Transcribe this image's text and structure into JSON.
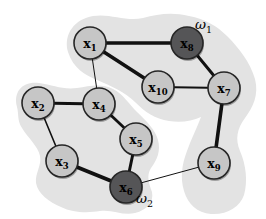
{
  "diagram": {
    "width": 266,
    "height": 219,
    "node_radius": 16,
    "colors": {
      "background": "#ffffff",
      "cluster_fill": "#e3e3e3",
      "node_light_fill": "#c6c6c6",
      "node_dark_fill": "#555557",
      "node_stroke": "#262626",
      "edge_stroke": "#111111",
      "label_color": "#000000",
      "node_shadow": "rgba(0,0,0,0.30)"
    },
    "clusters": [
      {
        "id": "omega1",
        "label": "ω",
        "sub": "1",
        "label_x": 195,
        "label_y": 29,
        "path": "M 68,52 C 63,34 75,19 93,16 C 110,13 126,22 143,18 C 158,14 172,12 189,16 C 205,19 217,26 227,36 C 239,48 250,62 255,79 C 259,95 253,107 245,118 C 237,129 235,139 240,151 C 246,165 248,181 244,195 C 240,207 227,215 211,214 C 197,213 188,204 184,191 C 180,177 182,164 187,151 C 191,139 197,128 201,117 C 192,121 181,123 169,121 C 155,119 145,112 135,102 C 125,92 111,86 97,80 C 85,75 73,68 68,52 Z"
      },
      {
        "id": "omega2",
        "label": "ω",
        "sub": "2",
        "label_x": 136,
        "label_y": 203,
        "path": "M 17,107 C 13,91 23,81 39,83 C 53,85 63,90 77,88 C 90,86 101,83 113,89 C 123,94 129,104 137,112 C 147,122 155,129 158,140 C 161,151 157,160 151,168 C 146,176 149,184 152,192 C 154,202 147,210 135,213 C 123,216 112,209 100,211 C 88,213 73,213 61,207 C 49,202 38,194 36,183 C 35,173 42,165 40,156 C 38,146 28,138 22,128 C 17,120 19,115 17,107 Z"
      }
    ],
    "nodes": [
      {
        "id": "x1",
        "label": "x",
        "sub": "1",
        "x": 90,
        "y": 43,
        "shade": "light"
      },
      {
        "id": "x2",
        "label": "x",
        "sub": "2",
        "x": 38,
        "y": 103,
        "shade": "light"
      },
      {
        "id": "x3",
        "label": "x",
        "sub": "3",
        "x": 62,
        "y": 161,
        "shade": "light"
      },
      {
        "id": "x4",
        "label": "x",
        "sub": "4",
        "x": 99,
        "y": 104,
        "shade": "light"
      },
      {
        "id": "x5",
        "label": "x",
        "sub": "5",
        "x": 136,
        "y": 139,
        "shade": "light"
      },
      {
        "id": "x6",
        "label": "x",
        "sub": "6",
        "x": 126,
        "y": 187,
        "shade": "dark"
      },
      {
        "id": "x7",
        "label": "x",
        "sub": "7",
        "x": 224,
        "y": 88,
        "shade": "light"
      },
      {
        "id": "x8",
        "label": "x",
        "sub": "8",
        "x": 187,
        "y": 43,
        "shade": "dark"
      },
      {
        "id": "x9",
        "label": "x",
        "sub": "9",
        "x": 214,
        "y": 163,
        "shade": "light"
      },
      {
        "id": "x10",
        "label": "x",
        "sub": "10",
        "x": 158,
        "y": 87,
        "shade": "light"
      }
    ],
    "edges": [
      {
        "from": "x1",
        "to": "x8",
        "width": 3.6
      },
      {
        "from": "x1",
        "to": "x10",
        "width": 3.6
      },
      {
        "from": "x1",
        "to": "x4",
        "width": 1
      },
      {
        "from": "x8",
        "to": "x7",
        "width": 3
      },
      {
        "from": "x10",
        "to": "x7",
        "width": 2
      },
      {
        "from": "x7",
        "to": "x9",
        "width": 3.6
      },
      {
        "from": "x2",
        "to": "x4",
        "width": 3
      },
      {
        "from": "x2",
        "to": "x3",
        "width": 1.6
      },
      {
        "from": "x4",
        "to": "x5",
        "width": 2.8
      },
      {
        "from": "x3",
        "to": "x6",
        "width": 4
      },
      {
        "from": "x5",
        "to": "x6",
        "width": 3
      },
      {
        "from": "x6",
        "to": "x9",
        "width": 1
      }
    ]
  }
}
